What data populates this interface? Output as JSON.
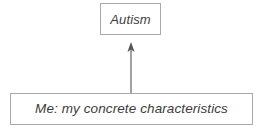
{
  "diagram": {
    "type": "flowchart",
    "background_color": "#ffffff",
    "border_color": "#a9a9a9",
    "text_color": "#3c3c3c",
    "nodes": [
      {
        "id": "autism",
        "label": "Autism",
        "shape": "rectangle",
        "position": "top-center"
      },
      {
        "id": "me",
        "label": "Me: my concrete characteristics",
        "shape": "rectangle",
        "position": "bottom-full-width"
      }
    ],
    "edges": [
      {
        "id": "me-to-autism",
        "from": "me",
        "to": "autism",
        "style": "solid",
        "arrowhead": "up",
        "color": "#555555"
      }
    ]
  }
}
